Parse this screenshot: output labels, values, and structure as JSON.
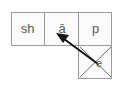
{
  "diagram": {
    "type": "phoneme-grapheme-mapping-box",
    "word": "shape",
    "cells": [
      {
        "id": "grapheme-1",
        "text": "sh"
      },
      {
        "id": "grapheme-2",
        "text": "ā"
      },
      {
        "id": "grapheme-3",
        "text": "p"
      }
    ],
    "silent_cell": {
      "id": "silent-e",
      "text": "e",
      "marked_out": true
    },
    "arrow": {
      "from": "silent-e",
      "to": "grapheme-2"
    },
    "colors": {
      "box_border": "#9a9a9a",
      "box_fill": "#fbfbfb",
      "text": "#5a5a5a",
      "arrow": "#1a1a1a",
      "cross_line": "#6e6e6e"
    }
  }
}
